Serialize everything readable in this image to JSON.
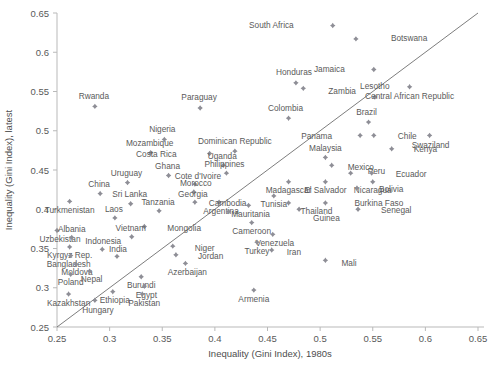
{
  "chart_data": {
    "type": "scatter",
    "title": "",
    "xlabel": "Inequality (Gini Index), 1980s",
    "ylabel": "Inequality (Gini Index), latest",
    "xlim": [
      0.25,
      0.65
    ],
    "ylim": [
      0.25,
      0.65
    ],
    "xticks": [
      "0.25",
      "0.3",
      "0.35",
      "0.4",
      "0.45",
      "0.5",
      "0.55",
      "0.6",
      "0.65"
    ],
    "yticks": [
      "0.25",
      "0.3",
      "0.35",
      "0.4",
      "0.45",
      "0.5",
      "0.55",
      "0.6",
      "0.65"
    ],
    "grid": false,
    "legend": "none",
    "reference_line": {
      "type": "45-degree",
      "from": [
        0.25,
        0.25
      ],
      "to": [
        0.65,
        0.65
      ]
    },
    "points": [
      {
        "label": "Rwanda",
        "x": 0.286,
        "y": 0.531,
        "lx": -1,
        "ly": -10
      },
      {
        "label": "Paraguay",
        "x": 0.386,
        "y": 0.529,
        "lx": -1,
        "ly": -10
      },
      {
        "label": "South Africa",
        "x": 0.512,
        "y": 0.634,
        "lx": -39,
        "ly": 0
      },
      {
        "label": "Botswana",
        "x": 0.534,
        "y": 0.617,
        "lx": 35,
        "ly": 0
      },
      {
        "label": "Jamaica",
        "x": 0.551,
        "y": 0.578,
        "lx": -29,
        "ly": 0
      },
      {
        "label": "Honduras",
        "x": 0.477,
        "y": 0.561,
        "lx": -2,
        "ly": -10
      },
      {
        "label": "Zambia",
        "x": 0.484,
        "y": 0.554,
        "lx": 25,
        "ly": 3
      },
      {
        "label": "Lesotho",
        "x": 0.552,
        "y": 0.543,
        "lx": 0,
        "ly": -10
      },
      {
        "label": "Central African Republic",
        "x": 0.585,
        "y": 0.556,
        "lx": 0,
        "ly": 10
      },
      {
        "label": "Colombia",
        "x": 0.47,
        "y": 0.516,
        "lx": -3,
        "ly": -10
      },
      {
        "label": "Nigeria",
        "x": 0.352,
        "y": 0.489,
        "lx": -2,
        "ly": -10
      },
      {
        "label": "Brazil",
        "x": 0.546,
        "y": 0.511,
        "lx": -2,
        "ly": -10
      },
      {
        "label": "Chile",
        "x": 0.551,
        "y": 0.494,
        "lx": 24,
        "ly": 1
      },
      {
        "label": "Panama",
        "x": 0.538,
        "y": 0.494,
        "lx": -28,
        "ly": 1
      },
      {
        "label": "Swaziland",
        "x": 0.604,
        "y": 0.494,
        "lx": 1,
        "ly": 10
      },
      {
        "label": "Kenya",
        "x": 0.568,
        "y": 0.477,
        "lx": 22,
        "ly": 1
      },
      {
        "label": "Mozambique",
        "x": 0.339,
        "y": 0.472,
        "lx": -1,
        "ly": -9
      },
      {
        "label": "Dominican Republic",
        "x": 0.419,
        "y": 0.474,
        "lx": 0,
        "ly": -10
      },
      {
        "label": "Costa Rica",
        "x": 0.395,
        "y": 0.471,
        "lx": -33,
        "ly": 1
      },
      {
        "label": "Malaysia",
        "x": 0.505,
        "y": 0.466,
        "lx": 0,
        "ly": -9
      },
      {
        "label": "Mexico",
        "x": 0.511,
        "y": 0.456,
        "lx": 16,
        "ly": 2
      },
      {
        "label": "Peru",
        "x": 0.529,
        "y": 0.446,
        "lx": 17,
        "ly": -2
      },
      {
        "label": "Ecuador",
        "x": 0.549,
        "y": 0.446,
        "lx": 24,
        "ly": 1
      },
      {
        "label": "Uganda",
        "x": 0.408,
        "y": 0.456,
        "lx": -1,
        "ly": -9
      },
      {
        "label": "Philippines",
        "x": 0.411,
        "y": 0.446,
        "lx": -2,
        "ly": -9
      },
      {
        "label": "Ghana",
        "x": 0.356,
        "y": 0.443,
        "lx": -1,
        "ly": -9
      },
      {
        "label": "Uruguay",
        "x": 0.317,
        "y": 0.434,
        "lx": -1,
        "ly": -9
      },
      {
        "label": "China",
        "x": 0.291,
        "y": 0.42,
        "lx": -1,
        "ly": -9
      },
      {
        "label": "Cote d'Ivoire",
        "x": 0.381,
        "y": 0.432,
        "lx": 3,
        "ly": -8
      },
      {
        "label": "Morocco",
        "x": 0.38,
        "y": 0.422,
        "lx": 2,
        "ly": -8
      },
      {
        "label": "Nicaragua",
        "x": 0.55,
        "y": 0.435,
        "lx": 0,
        "ly": 9
      },
      {
        "label": "Madagascar",
        "x": 0.47,
        "y": 0.435,
        "lx": 0,
        "ly": 9
      },
      {
        "label": "El Salvador",
        "x": 0.505,
        "y": 0.435,
        "lx": 0,
        "ly": 9
      },
      {
        "label": "Bolivia",
        "x": 0.535,
        "y": 0.427,
        "lx": 22,
        "ly": 1
      },
      {
        "label": "Turkmenistan",
        "x": 0.262,
        "y": 0.41,
        "lx": 0,
        "ly": 9
      },
      {
        "label": "Sri Lanka",
        "x": 0.32,
        "y": 0.407,
        "lx": -1,
        "ly": -9
      },
      {
        "label": "Georgia",
        "x": 0.381,
        "y": 0.409,
        "lx": -2,
        "ly": -8
      },
      {
        "label": "Argentina",
        "x": 0.404,
        "y": 0.409,
        "lx": 2,
        "ly": 9
      },
      {
        "label": "Mauritania",
        "x": 0.432,
        "y": 0.405,
        "lx": 2,
        "ly": 9
      },
      {
        "label": "Tunisia",
        "x": 0.456,
        "y": 0.417,
        "lx": 0,
        "ly": 9
      },
      {
        "label": "Thailand",
        "x": 0.47,
        "y": 0.408,
        "lx": 12,
        "ly": 9
      },
      {
        "label": "Guinea",
        "x": 0.48,
        "y": 0.4,
        "lx": 14,
        "ly": 9
      },
      {
        "label": "Burkina Faso",
        "x": 0.505,
        "y": 0.408,
        "lx": 29,
        "ly": 1
      },
      {
        "label": "Senegal",
        "x": 0.536,
        "y": 0.4,
        "lx": 23,
        "ly": 1
      },
      {
        "label": "Uzbekistan",
        "x": 0.25,
        "y": 0.373,
        "lx": 3,
        "ly": 9
      },
      {
        "label": "Tanzania",
        "x": 0.347,
        "y": 0.398,
        "lx": -1,
        "ly": -8
      },
      {
        "label": "Laos",
        "x": 0.305,
        "y": 0.389,
        "lx": -1,
        "ly": -8
      },
      {
        "label": "Cambodia",
        "x": 0.413,
        "y": 0.397,
        "lx": -1,
        "ly": -8
      },
      {
        "label": "Cameroon",
        "x": 0.435,
        "y": 0.383,
        "lx": 0,
        "ly": 9
      },
      {
        "label": "Mongolia",
        "x": 0.333,
        "y": 0.378,
        "lx": 23,
        "ly": 2
      },
      {
        "label": "Albania",
        "x": 0.264,
        "y": 0.364,
        "lx": 0,
        "ly": -8
      },
      {
        "label": "Vietnam",
        "x": 0.321,
        "y": 0.365,
        "lx": -1,
        "ly": -8
      },
      {
        "label": "Venezuela",
        "x": 0.455,
        "y": 0.368,
        "lx": 2,
        "ly": 9
      },
      {
        "label": "Turkey",
        "x": 0.44,
        "y": 0.358,
        "lx": 0,
        "ly": 9
      },
      {
        "label": "Kyrgyz Rep.",
        "x": 0.262,
        "y": 0.352,
        "lx": 0,
        "ly": 9
      },
      {
        "label": "Indonesia",
        "x": 0.293,
        "y": 0.349,
        "lx": 1,
        "ly": -8
      },
      {
        "label": "Niger",
        "x": 0.36,
        "y": 0.353,
        "lx": 22,
        "ly": 2
      },
      {
        "label": "Bangladesh",
        "x": 0.263,
        "y": 0.341,
        "lx": -2,
        "ly": 9
      },
      {
        "label": "India",
        "x": 0.307,
        "y": 0.34,
        "lx": 1,
        "ly": -7
      },
      {
        "label": "Jordan",
        "x": 0.363,
        "y": 0.342,
        "lx": 22,
        "ly": 2
      },
      {
        "label": "Iran",
        "x": 0.454,
        "y": 0.348,
        "lx": 15,
        "ly": 2
      },
      {
        "label": "Moldova",
        "x": 0.268,
        "y": 0.33,
        "lx": 1,
        "ly": 8
      },
      {
        "label": "Azerbaijan",
        "x": 0.372,
        "y": 0.331,
        "lx": 2,
        "ly": 9
      },
      {
        "label": "Nepal",
        "x": 0.281,
        "y": 0.321,
        "lx": 2,
        "ly": 8
      },
      {
        "label": "Poland",
        "x": 0.263,
        "y": 0.317,
        "lx": 0,
        "ly": 8
      },
      {
        "label": "Burundi",
        "x": 0.33,
        "y": 0.314,
        "lx": 0,
        "ly": 9
      },
      {
        "label": "Egypt",
        "x": 0.333,
        "y": 0.302,
        "lx": 2,
        "ly": 9
      },
      {
        "label": "Kazakhstan",
        "x": 0.261,
        "y": 0.292,
        "lx": 0,
        "ly": 9
      },
      {
        "label": "Ethiopia",
        "x": 0.303,
        "y": 0.295,
        "lx": 2,
        "ly": 9
      },
      {
        "label": "Pakistan",
        "x": 0.331,
        "y": 0.292,
        "lx": 2,
        "ly": 9
      },
      {
        "label": "Armenia",
        "x": 0.437,
        "y": 0.297,
        "lx": 0,
        "ly": 9
      },
      {
        "label": "Mali",
        "x": 0.505,
        "y": 0.335,
        "lx": 16,
        "ly": 3
      },
      {
        "label": "Hungary",
        "x": 0.286,
        "y": 0.284,
        "lx": 3,
        "ly": 10
      }
    ]
  },
  "axes": {
    "x_title": "Inequality (Gini Index), 1980s",
    "y_title": "Inequality (Gini Index), latest"
  }
}
